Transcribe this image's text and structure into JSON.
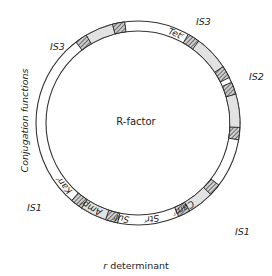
{
  "figure": {
    "type": "circular-plasmid-map",
    "center_label": "R-factor",
    "bottom_caption": "r determinant",
    "side_caption": "Conjugation functions"
  },
  "colors": {
    "ring_stroke": "#333333",
    "segment_fill": "#e2e2e2",
    "is_block_fill": "#b9b9b9",
    "is_block_stroke": "#2a2a2a",
    "background": "#ffffff",
    "text": "#1d1d1d"
  },
  "geometry": {
    "center_x": 138,
    "center_y": 123,
    "outer_radius": 102,
    "inner_radius": 92
  },
  "is_labels": [
    {
      "id": "is3-top-right",
      "text": "IS3",
      "x": 196,
      "y": 16
    },
    {
      "id": "is3-top-left",
      "text": "IS3",
      "x": 50,
      "y": 41
    },
    {
      "id": "is2-right",
      "text": "IS2",
      "x": 249,
      "y": 71
    },
    {
      "id": "is1-left",
      "text": "IS1",
      "x": 27,
      "y": 202
    },
    {
      "id": "is1-right",
      "text": "IS1",
      "x": 235,
      "y": 226
    }
  ],
  "gene_labels": [
    {
      "id": "tet",
      "text": "Tetʳ",
      "start_angle": -76,
      "end_angle": -58
    },
    {
      "id": "cam",
      "text": "Camʳ",
      "start_angle": 52,
      "end_angle": 72
    },
    {
      "id": "str",
      "text": "Strʳ",
      "start_angle": 74,
      "end_angle": 90
    },
    {
      "id": "sul",
      "text": "Sulʳ",
      "start_angle": 92,
      "end_angle": 108
    },
    {
      "id": "amp",
      "text": "Ampʳ",
      "start_angle": 110,
      "end_angle": 128
    },
    {
      "id": "kan",
      "text": "Kanʳ",
      "start_angle": 130,
      "end_angle": 150
    }
  ],
  "is_elements": [
    {
      "id": "is3-tr",
      "block_a_angle": -57,
      "body_start": -54,
      "body_end": -33,
      "block_b_angle": -30
    },
    {
      "id": "is3-tl",
      "block_a_angle": -124,
      "body_start": -121,
      "body_end": -104,
      "block_b_angle": -101
    },
    {
      "id": "is2-r",
      "block_a_angle": -20,
      "body_start": -17,
      "body_end": 3,
      "block_b_angle": 6
    },
    {
      "id": "is1-l",
      "block_a_angle": 105,
      "body_start": 108,
      "body_end": 124,
      "block_b_angle": 127
    },
    {
      "id": "is1-r",
      "block_a_angle": 41,
      "body_start": 44,
      "body_end": 60,
      "block_b_angle": 63
    }
  ]
}
